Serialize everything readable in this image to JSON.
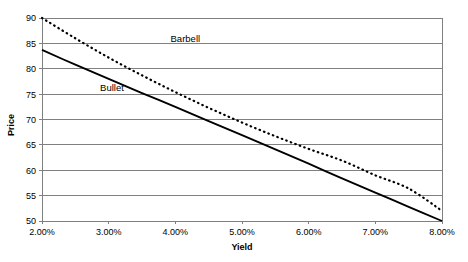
{
  "chart_data": {
    "type": "line",
    "title": "",
    "xlabel": "Yield",
    "ylabel": "Price",
    "xlim": [
      2.0,
      8.0
    ],
    "ylim": [
      50,
      90
    ],
    "grid": "horizontal",
    "legend_position": "inline-annotations",
    "x_tick_labels": [
      "2.00%",
      "3.00%",
      "4.00%",
      "5.00%",
      "6.00%",
      "7.00%",
      "8.00%"
    ],
    "x_tick_values": [
      2.0,
      3.0,
      4.0,
      5.0,
      6.0,
      7.0,
      8.0
    ],
    "y_tick_labels": [
      "50",
      "55",
      "60",
      "65",
      "70",
      "75",
      "80",
      "85",
      "90"
    ],
    "y_tick_values": [
      50,
      55,
      60,
      65,
      70,
      75,
      80,
      85,
      90
    ],
    "series": [
      {
        "name": "Barbell",
        "style": "dashed",
        "color": "#000000",
        "label_x": 4.15,
        "label_y": 85.2,
        "x": [
          2.0,
          2.5,
          3.0,
          3.5,
          4.0,
          4.5,
          5.0,
          5.5,
          6.0,
          6.5,
          7.0,
          7.5,
          8.0
        ],
        "values": [
          90.0,
          86.0,
          82.2,
          78.7,
          75.4,
          72.3,
          69.4,
          66.7,
          64.2,
          61.9,
          59.0,
          56.4,
          52.0
        ]
      },
      {
        "name": "Bullet",
        "style": "solid",
        "color": "#000000",
        "label_x": 3.05,
        "label_y": 75.7,
        "x": [
          2.0,
          2.5,
          3.0,
          3.5,
          4.0,
          4.5,
          5.0,
          5.5,
          6.0,
          6.5,
          7.0,
          7.5,
          8.0
        ],
        "values": [
          83.7,
          80.8,
          78.0,
          75.2,
          72.5,
          69.7,
          66.9,
          64.1,
          61.3,
          58.4,
          55.6,
          52.8,
          50.0
        ]
      }
    ]
  },
  "axes": {
    "x_title": "Yield",
    "y_title": "Price"
  },
  "style_tokens": {
    "gridline_color": "#808080",
    "axis_color": "#808080",
    "series_color": "#000000",
    "background": "#ffffff"
  }
}
